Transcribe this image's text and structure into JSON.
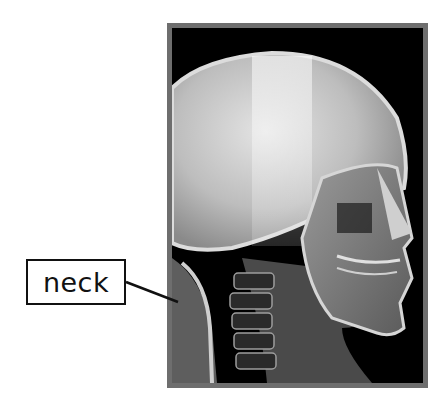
{
  "figure": {
    "frame_color": "#6e6e6e",
    "background_color": "#000000"
  },
  "labels": [
    {
      "text": "neck",
      "target": "cervical-spine"
    }
  ]
}
